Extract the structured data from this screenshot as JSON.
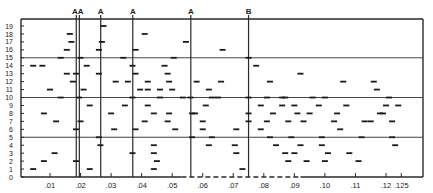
{
  "chart_data": {
    "type": "scatter",
    "title": "",
    "xlabel": "",
    "ylabel": "",
    "marker": "short horizontal dash",
    "xlim": [
      0.0,
      0.13
    ],
    "ylim": [
      0,
      19
    ],
    "x_ticks": [
      {
        "value": 0.01,
        "label": ".01"
      },
      {
        "value": 0.02,
        "label": ".02"
      },
      {
        "value": 0.03,
        "label": ".03"
      },
      {
        "value": 0.04,
        "label": ".04"
      },
      {
        "value": 0.05,
        "label": ".05"
      },
      {
        "value": 0.06,
        "label": ".06"
      },
      {
        "value": 0.07,
        "label": ".07"
      },
      {
        "value": 0.08,
        "label": ".08"
      },
      {
        "value": 0.09,
        "label": ".09"
      },
      {
        "value": 0.1,
        "label": ".10"
      },
      {
        "value": 0.11,
        "label": ".11"
      },
      {
        "value": 0.12,
        "label": ".12"
      },
      {
        "value": 0.125,
        "label": ".125"
      }
    ],
    "y_ticks": [
      "0",
      "1",
      "2",
      "3",
      "4",
      "5",
      "6",
      "7",
      "8",
      "9",
      "10",
      "11",
      "12",
      "13",
      "14",
      "15",
      "16",
      "17",
      "18",
      "19"
    ],
    "horizontal_gridlines": [
      5,
      10,
      15
    ],
    "vertical_markers": [
      {
        "x": 0.0186,
        "label": "A"
      },
      {
        "x": 0.0196,
        "label": "A"
      },
      {
        "x": 0.0266,
        "label": "A"
      },
      {
        "x": 0.0371,
        "label": "A"
      },
      {
        "x": 0.0561,
        "label": "A"
      },
      {
        "x": 0.075,
        "label": "B"
      }
    ],
    "points": [
      [
        0.0045,
        1
      ],
      [
        0.008,
        2
      ],
      [
        0.0115,
        3
      ],
      [
        0.008,
        8
      ],
      [
        0.012,
        7
      ],
      [
        0.0135,
        10
      ],
      [
        0.01,
        11
      ],
      [
        0.0175,
        12
      ],
      [
        0.0185,
        13
      ],
      [
        0.0155,
        13
      ],
      [
        0.0075,
        14
      ],
      [
        0.0045,
        14
      ],
      [
        0.0135,
        15
      ],
      [
        0.0155,
        16
      ],
      [
        0.017,
        17
      ],
      [
        0.0165,
        18
      ],
      [
        0.0185,
        2
      ],
      [
        0.0185,
        6
      ],
      [
        0.0195,
        10
      ],
      [
        0.02,
        7
      ],
      [
        0.02,
        15
      ],
      [
        0.022,
        14
      ],
      [
        0.023,
        1
      ],
      [
        0.023,
        9
      ],
      [
        0.021,
        11
      ],
      [
        0.0265,
        4
      ],
      [
        0.026,
        5
      ],
      [
        0.026,
        13
      ],
      [
        0.026,
        16
      ],
      [
        0.027,
        17
      ],
      [
        0.0275,
        19
      ],
      [
        0.031,
        6
      ],
      [
        0.03,
        8
      ],
      [
        0.0345,
        9
      ],
      [
        0.0315,
        12
      ],
      [
        0.034,
        15
      ],
      [
        0.0355,
        12
      ],
      [
        0.037,
        3
      ],
      [
        0.038,
        6
      ],
      [
        0.037,
        10
      ],
      [
        0.037,
        14
      ],
      [
        0.038,
        13
      ],
      [
        0.038,
        16
      ],
      [
        0.041,
        18
      ],
      [
        0.0395,
        11
      ],
      [
        0.042,
        11
      ],
      [
        0.041,
        7
      ],
      [
        0.042,
        9
      ],
      [
        0.044,
        1
      ],
      [
        0.044,
        4
      ],
      [
        0.046,
        10
      ],
      [
        0.0485,
        7
      ],
      [
        0.0475,
        14
      ],
      [
        0.046,
        11
      ],
      [
        0.049,
        8
      ],
      [
        0.042,
        12
      ],
      [
        0.045,
        2
      ],
      [
        0.044,
        3
      ],
      [
        0.05,
        11
      ],
      [
        0.051,
        6
      ],
      [
        0.044,
        8
      ],
      [
        0.049,
        12
      ],
      [
        0.0535,
        10
      ],
      [
        0.0545,
        17
      ],
      [
        0.0505,
        15
      ],
      [
        0.0485,
        13
      ],
      [
        0.0565,
        5
      ],
      [
        0.0565,
        8
      ],
      [
        0.061,
        9
      ],
      [
        0.06,
        6
      ],
      [
        0.062,
        4
      ],
      [
        0.06,
        7
      ],
      [
        0.063,
        5
      ],
      [
        0.058,
        12
      ],
      [
        0.056,
        10
      ],
      [
        0.0575,
        8
      ],
      [
        0.062,
        11
      ],
      [
        0.066,
        12
      ],
      [
        0.0665,
        16
      ],
      [
        0.071,
        6
      ],
      [
        0.071,
        3
      ],
      [
        0.0705,
        4
      ],
      [
        0.073,
        1
      ],
      [
        0.065,
        10
      ],
      [
        0.063,
        10
      ],
      [
        0.075,
        10
      ],
      [
        0.075,
        15
      ],
      [
        0.0775,
        14
      ],
      [
        0.075,
        8
      ],
      [
        0.075,
        7
      ],
      [
        0.082,
        12
      ],
      [
        0.086,
        9
      ],
      [
        0.079,
        9
      ],
      [
        0.081,
        10
      ],
      [
        0.087,
        10
      ],
      [
        0.088,
        7
      ],
      [
        0.079,
        6
      ],
      [
        0.082,
        5
      ],
      [
        0.084,
        4
      ],
      [
        0.087,
        3
      ],
      [
        0.086,
        10
      ],
      [
        0.083,
        8
      ],
      [
        0.081,
        7
      ],
      [
        0.088,
        2
      ],
      [
        0.09,
        9
      ],
      [
        0.092,
        13
      ],
      [
        0.091,
        8
      ],
      [
        0.093,
        7
      ],
      [
        0.089,
        5
      ],
      [
        0.092,
        4
      ],
      [
        0.09,
        3
      ],
      [
        0.094,
        2
      ],
      [
        0.096,
        10
      ],
      [
        0.095,
        8
      ],
      [
        0.098,
        9
      ],
      [
        0.1,
        10
      ],
      [
        0.099,
        5
      ],
      [
        0.099,
        4
      ],
      [
        0.101,
        3
      ],
      [
        0.1,
        2
      ],
      [
        0.103,
        7
      ],
      [
        0.104,
        8
      ],
      [
        0.105,
        6
      ],
      [
        0.106,
        12
      ],
      [
        0.107,
        9
      ],
      [
        0.108,
        3
      ],
      [
        0.112,
        5
      ],
      [
        0.111,
        2
      ],
      [
        0.113,
        7
      ],
      [
        0.115,
        7
      ],
      [
        0.117,
        11
      ],
      [
        0.118,
        8
      ],
      [
        0.116,
        12
      ],
      [
        0.119,
        8
      ],
      [
        0.121,
        10
      ],
      [
        0.122,
        5
      ],
      [
        0.123,
        4
      ],
      [
        0.124,
        9
      ],
      [
        0.122,
        7
      ],
      [
        0.12,
        9
      ]
    ]
  }
}
